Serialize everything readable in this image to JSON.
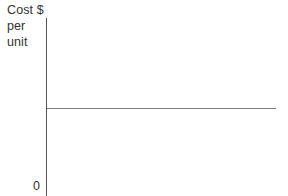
{
  "chart_data": {
    "type": "line",
    "title": "",
    "subtitle": "",
    "ylabel_lines": [
      "Cost $",
      "per",
      "unit"
    ],
    "ylabel": "Cost $ per unit",
    "xlabel": "",
    "grid": false,
    "legend": null,
    "annotations": [],
    "axes": {
      "y_axis_visible": true,
      "x_axis_visible": false,
      "y_ticks": [
        "0"
      ],
      "x_ticks": [],
      "origin_label": "0",
      "xlim": [
        0,
        1
      ],
      "ylim": [
        0,
        1
      ]
    },
    "series": [
      {
        "name": "Cost per unit",
        "description": "constant horizontal line",
        "x": [
          0,
          1
        ],
        "values": [
          0.44,
          0.44
        ],
        "color": "#7d7d7d"
      }
    ]
  },
  "colors": {
    "background": "#ffffff",
    "axis": "#555555",
    "series_line": "#7d7d7d",
    "text": "#333333"
  }
}
